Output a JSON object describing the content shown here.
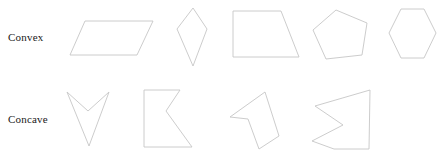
{
  "figure": {
    "background_color": "#ffffff",
    "stroke_color": "#c6c6c6",
    "label_color": "#1a1a1a",
    "width": 445,
    "height": 159
  },
  "rows": [
    {
      "label": "Convex",
      "shapes": [
        {
          "name": "parallelogram",
          "vertex_count": 4,
          "points": "85,21 153,21 137,55 70,55"
        },
        {
          "name": "kite",
          "vertex_count": 4,
          "points": "193,8 207,29 193,66 177,29"
        },
        {
          "name": "trapezoid",
          "vertex_count": 4,
          "points": "233,11 281,11 299,57 233,57"
        },
        {
          "name": "pentagon",
          "vertex_count": 5,
          "points": "336,10 367,23 362,55 326,59 313,30"
        },
        {
          "name": "hexagon",
          "vertex_count": 6,
          "points": "401,9 424,9 436,33 424,58 401,58 389,33"
        }
      ]
    },
    {
      "label": "Concave",
      "shapes": [
        {
          "name": "arrowhead-chevron",
          "vertex_count": 4,
          "points": "67,92 88,111 109,92 89,146"
        },
        {
          "name": "notched-block",
          "vertex_count": 5,
          "points": "144,90 180,90 166,111 192,147 144,147"
        },
        {
          "name": "dart-quadrilateral",
          "vertex_count": 5,
          "points": "265,92 279,136 259,149 248,119 230,117"
        },
        {
          "name": "bowtie-polygon",
          "vertex_count": 6,
          "points": "370,90 315,106 343,125 312,141 334,149 369,149"
        }
      ]
    },
    {
      "label": "",
      "shapes": []
    }
  ]
}
